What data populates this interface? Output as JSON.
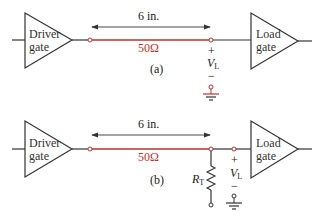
{
  "colors": {
    "line": "#333333",
    "transmission_line": "#b5352e",
    "background": "#ffffff"
  },
  "panel_a": {
    "caption": "(a)",
    "driver": {
      "line1": "Driver",
      "line2": "gate"
    },
    "load": {
      "line1": "Load",
      "line2": "gate"
    },
    "length_label": "6 in.",
    "impedance_label": "50Ω",
    "voltage": {
      "plus": "+",
      "symbol": "V",
      "subscript": "L",
      "minus": "−"
    }
  },
  "panel_b": {
    "caption": "(b)",
    "driver": {
      "line1": "Driver",
      "line2": "gate"
    },
    "load": {
      "line1": "Load",
      "line2": "gate"
    },
    "length_label": "6 in.",
    "impedance_label": "50Ω",
    "resistor": {
      "symbol": "R",
      "subscript": "T"
    },
    "voltage": {
      "plus": "+",
      "symbol": "V",
      "subscript": "L",
      "minus": "−"
    }
  }
}
